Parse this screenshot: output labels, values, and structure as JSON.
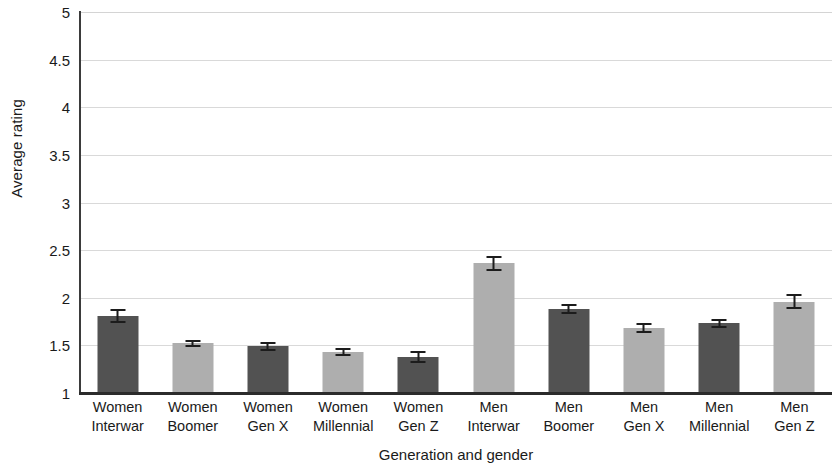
{
  "chart_data": {
    "type": "bar",
    "title": "",
    "xlabel": "Generation and gender",
    "ylabel": "Average rating",
    "ylim": [
      1,
      5
    ],
    "ytick_labels": [
      "5",
      "4.5",
      "4",
      "3.5",
      "3",
      "2.5",
      "2",
      "1.5",
      "1"
    ],
    "yticks": [
      5,
      4.5,
      4,
      3.5,
      3,
      2.5,
      2,
      1.5,
      1
    ],
    "grid": true,
    "legend": "none",
    "categories": [
      "Women Interwar",
      "Women Boomer",
      "Women Gen X",
      "Women Millennial",
      "Women Gen Z",
      "Men Interwar",
      "Men Boomer",
      "Men Gen X",
      "Men Millennial",
      "Men Gen Z"
    ],
    "category_lines": [
      {
        "line1": "Women",
        "line2": "Interwar"
      },
      {
        "line1": "Women",
        "line2": "Boomer"
      },
      {
        "line1": "Women",
        "line2": "Gen X"
      },
      {
        "line1": "Women",
        "line2": "Millennial"
      },
      {
        "line1": "Women",
        "line2": "Gen Z"
      },
      {
        "line1": "Men",
        "line2": "Interwar"
      },
      {
        "line1": "Men",
        "line2": "Boomer"
      },
      {
        "line1": "Men",
        "line2": "Gen X"
      },
      {
        "line1": "Men",
        "line2": "Millennial"
      },
      {
        "line1": "Men",
        "line2": "Gen Z"
      }
    ],
    "values": [
      1.81,
      1.52,
      1.49,
      1.43,
      1.38,
      2.36,
      1.88,
      1.68,
      1.73,
      1.96
    ],
    "errors": [
      0.07,
      0.04,
      0.05,
      0.04,
      0.06,
      0.08,
      0.05,
      0.05,
      0.05,
      0.08
    ],
    "bar_shades": [
      "dark",
      "light",
      "dark",
      "light",
      "dark",
      "light",
      "dark",
      "light",
      "dark",
      "light"
    ],
    "colors": {
      "bar_dark": "#525252",
      "bar_light": "#aeaeae",
      "gridline": "#d9d9d9",
      "axis": "#2b2b2b",
      "error_bar": "#1c1c1c",
      "text": "#1a1a1a",
      "background": "#ffffff"
    }
  }
}
